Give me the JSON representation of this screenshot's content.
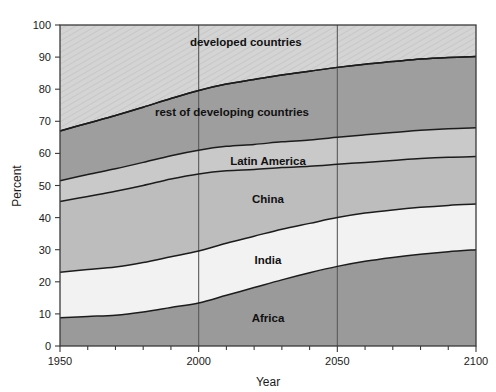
{
  "chart_data": {
    "type": "area",
    "title": "",
    "xlabel": "Year",
    "ylabel": "Percent",
    "xlim": [
      1950,
      2100
    ],
    "ylim": [
      0,
      100
    ],
    "grid": false,
    "legend_position": "inline-labels",
    "stacked": true,
    "normalized_percent": true,
    "x": [
      1950,
      1960,
      1970,
      1980,
      1990,
      2000,
      2010,
      2020,
      2030,
      2040,
      2050,
      2060,
      2070,
      2080,
      2090,
      2100
    ],
    "xticks": [
      1950,
      2000,
      2050,
      2100
    ],
    "xtick_labels": [
      "1950",
      "2000",
      "2050",
      "2100"
    ],
    "xminor_tick_step": 10,
    "yticks": [
      0,
      10,
      20,
      30,
      40,
      50,
      60,
      70,
      80,
      90,
      100
    ],
    "ytick_labels": [
      "0",
      "10",
      "20",
      "30",
      "40",
      "50",
      "60",
      "70",
      "80",
      "90",
      "100"
    ],
    "vertical_reference_lines": [
      2000,
      2050
    ],
    "series": [
      {
        "name": "Africa",
        "label": "Africa",
        "fill": "#9a9a9a",
        "values": [
          8.8,
          9.2,
          9.6,
          10.6,
          12.0,
          13.4,
          15.8,
          18.2,
          20.6,
          22.8,
          24.8,
          26.4,
          27.6,
          28.6,
          29.4,
          30.0
        ],
        "cumulative_top": [
          8.8,
          9.2,
          9.6,
          10.6,
          12.0,
          13.4,
          15.8,
          18.2,
          20.6,
          22.8,
          24.8,
          26.4,
          27.6,
          28.6,
          29.4,
          30.0
        ],
        "label_x": 2025,
        "label_y": 7.5
      },
      {
        "name": "India",
        "label": "India",
        "fill": "#f2f2f2",
        "values": [
          14.2,
          14.6,
          15.0,
          15.4,
          15.8,
          16.2,
          16.2,
          16.0,
          15.8,
          15.4,
          15.2,
          15.0,
          14.8,
          14.6,
          14.4,
          14.2
        ],
        "cumulative_top": [
          23.0,
          23.8,
          24.6,
          26.0,
          27.8,
          29.6,
          32.0,
          34.2,
          36.4,
          38.2,
          40.0,
          41.4,
          42.4,
          43.2,
          43.8,
          44.2
        ],
        "label_x": 2025,
        "label_y": 25.5
      },
      {
        "name": "China",
        "label": "China",
        "fill": "#bdbdbd",
        "values": [
          22.0,
          22.8,
          23.6,
          24.0,
          24.2,
          24.0,
          22.6,
          20.8,
          19.2,
          17.8,
          16.6,
          15.8,
          15.4,
          15.2,
          15.0,
          14.8
        ],
        "cumulative_top": [
          45.0,
          46.6,
          48.2,
          50.0,
          52.0,
          53.6,
          54.6,
          55.0,
          55.6,
          56.0,
          56.6,
          57.2,
          57.8,
          58.4,
          58.8,
          59.0
        ],
        "label_x": 2025,
        "label_y": 44.5
      },
      {
        "name": "Latin America",
        "label": "Latin America",
        "fill": "#c9c9c9",
        "values": [
          6.5,
          6.8,
          7.0,
          7.2,
          7.3,
          7.4,
          7.6,
          7.8,
          8.0,
          8.2,
          8.4,
          8.6,
          8.7,
          8.8,
          8.9,
          9.0
        ],
        "cumulative_top": [
          51.5,
          53.4,
          55.2,
          57.2,
          59.3,
          61.0,
          62.2,
          62.8,
          63.6,
          64.2,
          65.0,
          65.8,
          66.5,
          67.2,
          67.7,
          68.0
        ],
        "label_x": 2025,
        "label_y": 56.5
      },
      {
        "name": "rest of developing countries",
        "label": "rest of developing countries",
        "fill": "#9e9e9e",
        "values": [
          15.5,
          16.0,
          16.6,
          17.2,
          17.8,
          18.6,
          19.4,
          20.2,
          20.8,
          21.4,
          21.8,
          22.0,
          22.1,
          22.2,
          22.2,
          22.2
        ],
        "cumulative_top": [
          67.0,
          69.4,
          71.8,
          74.4,
          77.1,
          79.6,
          81.6,
          83.0,
          84.4,
          85.6,
          86.8,
          87.8,
          88.6,
          89.4,
          89.9,
          90.2
        ],
        "label_x": 2012,
        "label_y": 71.5
      },
      {
        "name": "developed countries",
        "label": "developed countries",
        "fill": "#d4d4d4",
        "values": [
          33.0,
          30.6,
          28.2,
          25.6,
          22.9,
          20.4,
          18.4,
          17.0,
          15.6,
          14.4,
          13.2,
          12.2,
          11.4,
          10.6,
          10.1,
          9.8
        ],
        "cumulative_top": [
          100,
          100,
          100,
          100,
          100,
          100,
          100,
          100,
          100,
          100,
          100,
          100,
          100,
          100,
          100,
          100
        ],
        "label_x": 2017,
        "label_y": 93.5
      }
    ]
  },
  "axes": {
    "y_title": "Percent",
    "x_title": "Year"
  }
}
